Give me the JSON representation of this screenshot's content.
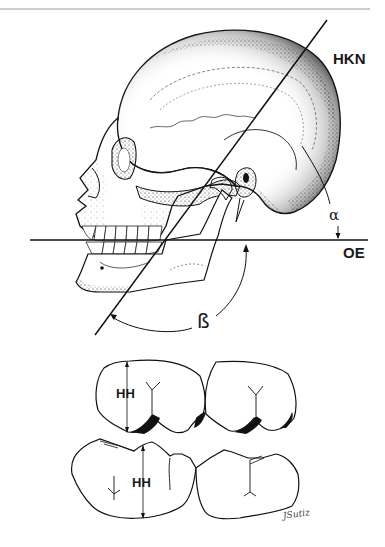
{
  "figure": {
    "type": "anatomical-line-drawing",
    "labels": {
      "hkn": "HKN",
      "oe": "OE",
      "alpha": "α",
      "beta": "ß",
      "hh_upper": "HH",
      "hh_lower": "HH"
    },
    "signature": "JSutiz",
    "colors": {
      "ink": "#1a1a1a",
      "background": "#ffffff",
      "stipple": "#2a2a2a",
      "rule": "#9a9a9a"
    }
  }
}
